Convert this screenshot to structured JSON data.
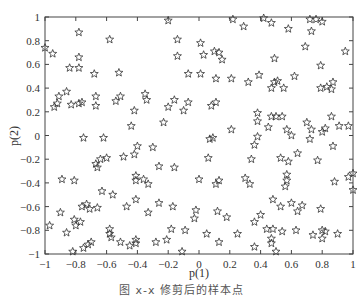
{
  "chart_data": {
    "type": "scatter",
    "title": "",
    "xlabel": "p(1)",
    "ylabel": "p(2)",
    "xlim": [
      -1,
      1
    ],
    "ylim": [
      -1,
      1
    ],
    "xticks": [
      -1,
      -0.8,
      -0.6,
      -0.4,
      -0.2,
      0,
      0.2,
      0.4,
      0.6,
      0.8,
      1
    ],
    "yticks": [
      -1,
      -0.8,
      -0.6,
      -0.4,
      -0.2,
      0,
      0.2,
      0.4,
      0.6,
      0.8,
      1
    ],
    "xtick_labels": [
      "-1",
      "-0.8",
      "-0.6",
      "-0.4",
      "-0.2",
      "0",
      "0.2",
      "0.4",
      "0.6",
      "0.8",
      "1"
    ],
    "ytick_labels": [
      "-1",
      "-0.8",
      "-0.6",
      "-0.4",
      "-0.2",
      "0",
      "0.2",
      "0.4",
      "0.6",
      "0.8",
      "1"
    ],
    "grid": false,
    "legend": null,
    "marker": "pentagram (hollow star)",
    "series": [
      {
        "name": "samples",
        "points": [
          [
            -1,
            0.74
          ],
          [
            -0.95,
            0.69
          ],
          [
            -0.78,
            0.87
          ],
          [
            -0.78,
            0.66
          ],
          [
            -0.78,
            0.57
          ],
          [
            -0.84,
            0.57
          ],
          [
            -0.68,
            0.52
          ],
          [
            -0.52,
            0.53
          ],
          [
            -0.58,
            0.81
          ],
          [
            -0.2,
            0.97
          ],
          [
            -0.94,
            0.24
          ],
          [
            -0.92,
            0.27
          ],
          [
            -0.91,
            0.33
          ],
          [
            -0.86,
            0.37
          ],
          [
            -0.83,
            0.26
          ],
          [
            -0.78,
            0.27
          ],
          [
            -0.76,
            0.28
          ],
          [
            -0.67,
            0.33
          ],
          [
            -0.67,
            0.25
          ],
          [
            -0.54,
            0.29
          ],
          [
            -0.51,
            0.33
          ],
          [
            -0.42,
            0.21
          ],
          [
            -0.35,
            0.35
          ],
          [
            -0.34,
            0.3
          ],
          [
            -0.44,
            0.08
          ],
          [
            -0.23,
            0.11
          ],
          [
            -0.2,
            0.24
          ],
          [
            -0.75,
            -0.02
          ],
          [
            -0.62,
            -0.02
          ],
          [
            -0.4,
            -0.09
          ],
          [
            -0.3,
            -0.1
          ],
          [
            -0.16,
            0.3
          ],
          [
            -0.14,
            0.67
          ],
          [
            0.22,
            0.98
          ],
          [
            0.42,
            0.99
          ],
          [
            0.29,
            0.92
          ],
          [
            0.47,
            0.95
          ],
          [
            0.58,
            0.9
          ],
          [
            0.72,
            0.98
          ],
          [
            0.76,
            0.98
          ],
          [
            0.8,
            0.96
          ],
          [
            0.73,
            0.88
          ],
          [
            0.69,
            0.75
          ],
          [
            0.95,
            0.71
          ],
          [
            -0.14,
            0.81
          ],
          [
            0.01,
            0.78
          ],
          [
            0.03,
            0.68
          ],
          [
            0.1,
            0.71
          ],
          [
            0.13,
            0.7
          ],
          [
            0.15,
            0.64
          ],
          [
            0.49,
            0.65
          ],
          [
            -0.07,
            0.52
          ],
          [
            0.01,
            0.52
          ],
          [
            0.11,
            0.48
          ],
          [
            0.21,
            0.48
          ],
          [
            0.32,
            0.45
          ],
          [
            0.39,
            0.51
          ],
          [
            0.49,
            0.45
          ],
          [
            0.51,
            0.46
          ],
          [
            0.47,
            0.4
          ],
          [
            0.55,
            0.4
          ],
          [
            0.62,
            0.5
          ],
          [
            0.79,
            0.59
          ],
          [
            0.79,
            0.4
          ],
          [
            0.83,
            0.41
          ],
          [
            0.86,
            0.39
          ],
          [
            0.87,
            0.45
          ],
          [
            -0.07,
            0.28
          ],
          [
            -0.1,
            0.21
          ],
          [
            0.08,
            0.25
          ],
          [
            0.11,
            0.28
          ],
          [
            0.38,
            0.19
          ],
          [
            0.38,
            0.12
          ],
          [
            0.47,
            0.16
          ],
          [
            0.5,
            0.16
          ],
          [
            0.54,
            0.16
          ],
          [
            0.45,
            0.07
          ],
          [
            0.21,
            0.05
          ],
          [
            0.57,
            0.05
          ],
          [
            0.6,
            0.0
          ],
          [
            0.7,
            0.11
          ],
          [
            0.86,
            0.16
          ],
          [
            0.91,
            0.08
          ],
          [
            0.97,
            0.08
          ],
          [
            0.73,
            0.05
          ],
          [
            0.8,
            0.03
          ],
          [
            0.82,
            0.06
          ],
          [
            0.72,
            -0.03
          ],
          [
            0.87,
            -0.09
          ],
          [
            0.38,
            -0.01
          ],
          [
            0.36,
            -0.08
          ],
          [
            0.07,
            -0.03
          ],
          [
            0.09,
            -0.02
          ],
          [
            -0.6,
            -0.19
          ],
          [
            -0.49,
            -0.18
          ],
          [
            -0.42,
            -0.16
          ],
          [
            -0.67,
            -0.24
          ],
          [
            -0.64,
            -0.2
          ],
          [
            -0.66,
            -0.27
          ],
          [
            -0.89,
            -0.37
          ],
          [
            -0.81,
            -0.38
          ],
          [
            -0.41,
            -0.34
          ],
          [
            -0.41,
            -0.38
          ],
          [
            -0.36,
            -0.37
          ],
          [
            -0.33,
            -0.41
          ],
          [
            -0.26,
            -0.26
          ],
          [
            -0.16,
            -0.27
          ],
          [
            -0.63,
            -0.47
          ],
          [
            -0.56,
            -0.5
          ],
          [
            -0.76,
            -0.6
          ],
          [
            -0.73,
            -0.58
          ],
          [
            -0.71,
            -0.62
          ],
          [
            -0.66,
            -0.61
          ],
          [
            -0.47,
            -0.6
          ],
          [
            -0.41,
            -0.54
          ],
          [
            -0.33,
            -0.65
          ],
          [
            -0.26,
            -0.57
          ],
          [
            -0.17,
            -0.6
          ],
          [
            -0.97,
            -0.76
          ],
          [
            -0.9,
            -0.65
          ],
          [
            -0.86,
            -0.82
          ],
          [
            -0.81,
            -0.71
          ],
          [
            -0.8,
            -0.76
          ],
          [
            -0.77,
            -0.73
          ],
          [
            -0.58,
            -0.79
          ],
          [
            -0.58,
            -0.83
          ],
          [
            -0.57,
            -0.86
          ],
          [
            -0.51,
            -0.9
          ],
          [
            -0.45,
            -0.93
          ],
          [
            -0.41,
            -0.91
          ],
          [
            -0.41,
            -0.88
          ],
          [
            -0.28,
            -0.9
          ],
          [
            -0.21,
            -0.88
          ],
          [
            -0.18,
            -0.79
          ],
          [
            -0.82,
            -0.98
          ],
          [
            -0.75,
            -0.95
          ],
          [
            -0.72,
            -0.92
          ],
          [
            -0.7,
            -0.9
          ],
          [
            0.06,
            -0.19
          ],
          [
            0.34,
            -0.2
          ],
          [
            0.53,
            -0.19
          ],
          [
            0.64,
            -0.15
          ],
          [
            0.58,
            -0.22
          ],
          [
            0.77,
            -0.21
          ],
          [
            0.0,
            -0.37
          ],
          [
            0.11,
            -0.41
          ],
          [
            0.13,
            -0.38
          ],
          [
            0.3,
            -0.36
          ],
          [
            0.33,
            -0.41
          ],
          [
            0.57,
            -0.33
          ],
          [
            0.57,
            -0.38
          ],
          [
            0.56,
            -0.43
          ],
          [
            0.88,
            -0.39
          ],
          [
            0.97,
            -0.35
          ],
          [
            0.48,
            -0.54
          ],
          [
            0.6,
            -0.57
          ],
          [
            0.67,
            -0.59
          ],
          [
            0.53,
            -0.6
          ],
          [
            0.64,
            -0.64
          ],
          [
            0.79,
            -0.62
          ],
          [
            -0.02,
            -0.63
          ],
          [
            0.12,
            -0.64
          ],
          [
            0.18,
            -0.69
          ],
          [
            -0.03,
            -0.7
          ],
          [
            0.4,
            -0.67
          ],
          [
            0.36,
            -0.73
          ],
          [
            0.44,
            -0.79
          ],
          [
            0.48,
            -0.79
          ],
          [
            0.54,
            -0.81
          ],
          [
            0.63,
            -0.8
          ],
          [
            0.74,
            -0.84
          ],
          [
            0.8,
            -0.87
          ],
          [
            0.8,
            -0.8
          ],
          [
            0.82,
            -0.81
          ],
          [
            0.9,
            -0.83
          ],
          [
            -0.09,
            -0.8
          ],
          [
            0.05,
            -0.83
          ],
          [
            0.25,
            -0.83
          ],
          [
            0.13,
            -0.9
          ],
          [
            0.47,
            -0.87
          ],
          [
            0.47,
            -0.91
          ],
          [
            0.36,
            -0.94
          ],
          [
            0.5,
            -0.98
          ],
          [
            1.0,
            -0.46
          ],
          [
            1.0,
            -0.32
          ],
          [
            -0.11,
            -0.98
          ]
        ]
      }
    ],
    "colors": {
      "marker": "#333333",
      "axis": "#444444",
      "background": "#ffffff"
    }
  },
  "figure": {
    "caption": "图 x-x 修剪后的样本点"
  }
}
